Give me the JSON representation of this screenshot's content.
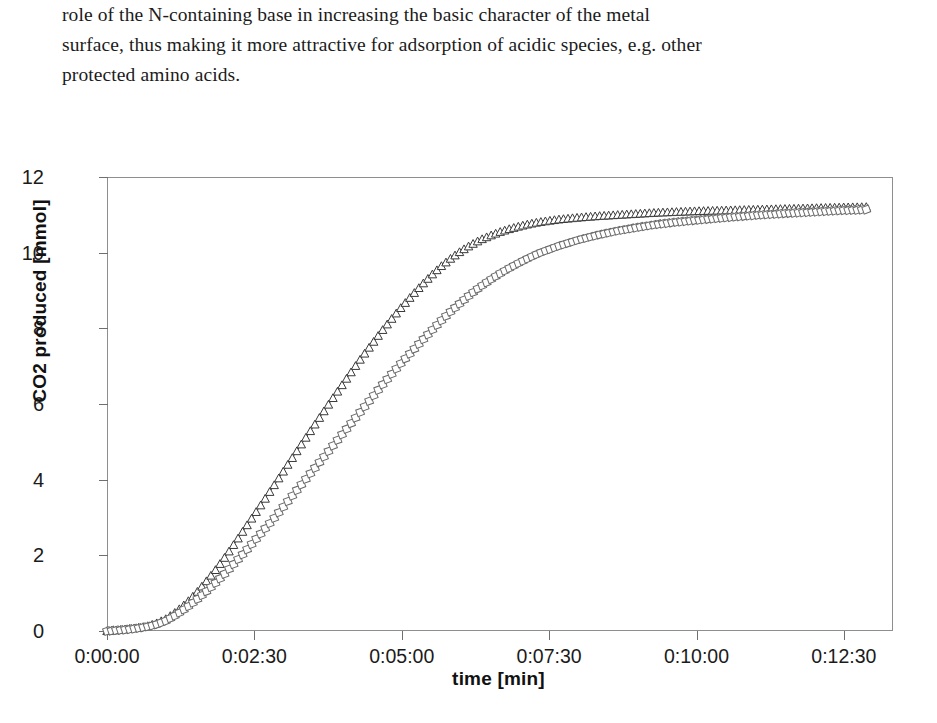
{
  "document": {
    "paragraph_lines": [
      "role of the N-containing base in increasing the basic character of the metal",
      "surface, thus making it more attractive for adsorption of acidic species, e.g. other",
      "protected amino acids."
    ]
  },
  "chart_data": {
    "type": "line",
    "title": "",
    "xlabel": "time [min]",
    "ylabel": "CO2 produced [mmol]",
    "xlim": [
      0,
      800
    ],
    "ylim": [
      0,
      12
    ],
    "grid": false,
    "legend": "none",
    "x_tick_labels": [
      "0:00:00",
      "0:02:30",
      "0:05:00",
      "0:07:30",
      "0:10:00",
      "0:12:30"
    ],
    "x_tick_values": [
      0,
      150,
      300,
      450,
      600,
      750
    ],
    "y_tick_labels": [
      "0",
      "2",
      "4",
      "6",
      "8",
      "10",
      "12"
    ],
    "y_tick_values": [
      0,
      2,
      4,
      6,
      8,
      10,
      12
    ],
    "series": [
      {
        "name": "fast catalyst",
        "marker": "triangle-open",
        "color": "#3a3a3a",
        "x": [
          0,
          10,
          20,
          30,
          40,
          50,
          60,
          70,
          80,
          90,
          100,
          110,
          120,
          130,
          140,
          150,
          160,
          170,
          180,
          190,
          200,
          210,
          220,
          230,
          240,
          250,
          260,
          270,
          280,
          290,
          300,
          310,
          320,
          330,
          340,
          350,
          360,
          370,
          380,
          390,
          400,
          410,
          420,
          430,
          440,
          460,
          480,
          500,
          520,
          540,
          560,
          580,
          600,
          630,
          660,
          690,
          720,
          750,
          775
        ],
        "y": [
          0.0,
          0.02,
          0.05,
          0.08,
          0.12,
          0.2,
          0.32,
          0.5,
          0.72,
          0.98,
          1.28,
          1.6,
          1.95,
          2.32,
          2.7,
          3.08,
          3.46,
          3.85,
          4.24,
          4.63,
          5.02,
          5.4,
          5.78,
          6.16,
          6.53,
          6.9,
          7.26,
          7.6,
          7.94,
          8.26,
          8.57,
          8.86,
          9.14,
          9.4,
          9.64,
          9.85,
          10.04,
          10.2,
          10.34,
          10.45,
          10.55,
          10.63,
          10.7,
          10.76,
          10.81,
          10.88,
          10.93,
          10.97,
          11.0,
          11.03,
          11.06,
          11.08,
          11.1,
          11.12,
          11.14,
          11.16,
          11.18,
          11.2,
          11.21
        ]
      },
      {
        "name": "slow catalyst",
        "marker": "square-open",
        "color": "#6a6a6a",
        "x": [
          0,
          10,
          20,
          30,
          40,
          50,
          60,
          70,
          80,
          90,
          100,
          110,
          120,
          130,
          140,
          150,
          160,
          170,
          180,
          190,
          200,
          210,
          220,
          230,
          240,
          250,
          260,
          270,
          280,
          290,
          300,
          310,
          320,
          330,
          340,
          350,
          360,
          370,
          380,
          390,
          400,
          410,
          420,
          430,
          440,
          460,
          480,
          500,
          520,
          540,
          560,
          580,
          600,
          630,
          660,
          690,
          720,
          750,
          775
        ],
        "y": [
          0.0,
          0.02,
          0.04,
          0.07,
          0.11,
          0.17,
          0.27,
          0.42,
          0.6,
          0.8,
          1.02,
          1.26,
          1.52,
          1.8,
          2.08,
          2.38,
          2.68,
          2.98,
          3.3,
          3.62,
          3.94,
          4.26,
          4.58,
          4.9,
          5.22,
          5.54,
          5.86,
          6.18,
          6.5,
          6.8,
          7.1,
          7.38,
          7.66,
          7.93,
          8.2,
          8.45,
          8.68,
          8.9,
          9.1,
          9.28,
          9.45,
          9.6,
          9.74,
          9.87,
          9.99,
          10.18,
          10.34,
          10.47,
          10.58,
          10.67,
          10.75,
          10.81,
          10.86,
          10.93,
          10.99,
          11.04,
          11.08,
          11.12,
          11.14
        ]
      }
    ]
  }
}
